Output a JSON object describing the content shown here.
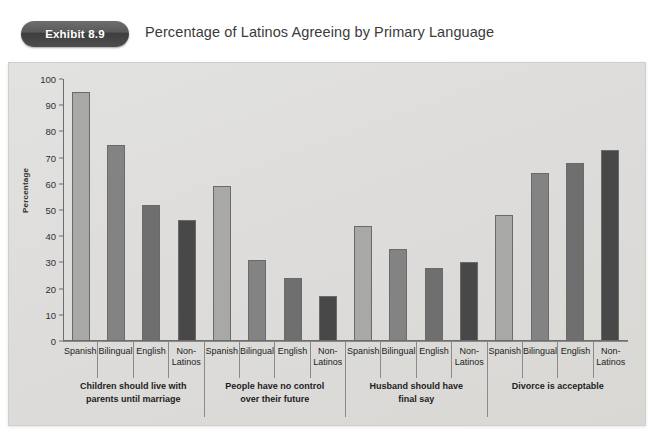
{
  "header": {
    "exhibit_badge": "Exhibit 8.9",
    "title": "Percentage of Latinos Agreeing by Primary Language"
  },
  "chart_data": {
    "type": "bar",
    "title": "Percentage of Latinos Agreeing by Primary Language",
    "xlabel": "",
    "ylabel": "Percentage",
    "ylim": [
      0,
      100
    ],
    "ytick_labels": [
      "100",
      "90",
      "80",
      "70",
      "60",
      "50",
      "40",
      "30",
      "20",
      "10",
      "0"
    ],
    "yticks": [
      100,
      90,
      80,
      70,
      60,
      50,
      40,
      30,
      20,
      10,
      0
    ],
    "grid": false,
    "legend": "none",
    "categories": [
      "Spanish",
      "Bilingual",
      "English",
      "Non-Latinos"
    ],
    "category_colors": [
      "#a8a8a6",
      "#838383",
      "#6f6f6f",
      "#484848"
    ],
    "groups": [
      {
        "label": "Children should live with parents until marriage",
        "label_lines": [
          "Children should live with",
          "parents until marriage"
        ],
        "values": [
          95,
          75,
          52,
          46
        ]
      },
      {
        "label": "People have no control over their future",
        "label_lines": [
          "People have no control",
          "over their future"
        ],
        "values": [
          59,
          31,
          24,
          17
        ]
      },
      {
        "label": "Husband should have final say",
        "label_lines": [
          "Husband should have",
          "final say"
        ],
        "values": [
          44,
          35,
          28,
          30
        ]
      },
      {
        "label": "Divorce is acceptable",
        "label_lines": [
          "Divorce is acceptable",
          ""
        ],
        "values": [
          48,
          64,
          68,
          73
        ]
      }
    ],
    "tick_label_lines": {
      "Spanish": [
        "Spanish",
        ""
      ],
      "Bilingual": [
        "Bilingual",
        ""
      ],
      "English": [
        "English",
        ""
      ],
      "Non-Latinos": [
        "Non-",
        "Latinos"
      ]
    }
  }
}
